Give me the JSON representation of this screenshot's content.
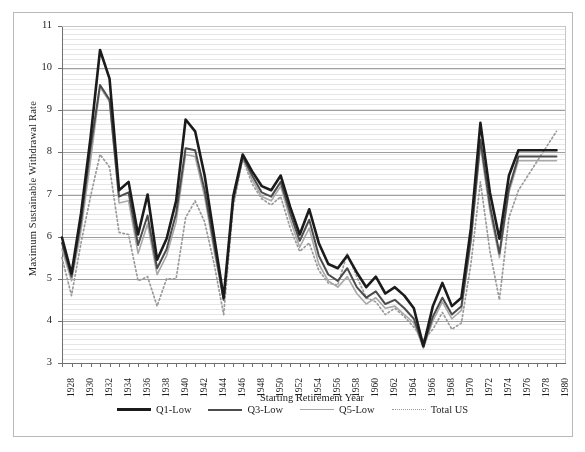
{
  "chart_data": {
    "type": "line",
    "title": "",
    "xlabel": "Starting Retirement Year",
    "ylabel": "Maximum Sustainable Withdrawal Rate",
    "xlim": [
      1928,
      1981
    ],
    "ylim": [
      3,
      11
    ],
    "ytick_step": 1,
    "xtick_step": 2,
    "grid": true,
    "legend_position": "bottom",
    "yticks": [
      3,
      4,
      5,
      6,
      7,
      8,
      9,
      10,
      11
    ],
    "ytick_labels": [
      "3",
      "4",
      "5",
      "6",
      "7",
      "8",
      "9",
      "10",
      "11"
    ],
    "x": [
      1928,
      1929,
      1930,
      1931,
      1932,
      1933,
      1934,
      1935,
      1936,
      1937,
      1938,
      1939,
      1940,
      1941,
      1942,
      1943,
      1944,
      1945,
      1946,
      1947,
      1948,
      1949,
      1950,
      1951,
      1952,
      1953,
      1954,
      1955,
      1956,
      1957,
      1958,
      1959,
      1960,
      1961,
      1962,
      1963,
      1964,
      1965,
      1966,
      1967,
      1968,
      1969,
      1970,
      1971,
      1972,
      1973,
      1974,
      1975,
      1976,
      1977,
      1978,
      1979,
      1980
    ],
    "xtick_labels": [
      "1928",
      "1930",
      "1932",
      "1934",
      "1936",
      "1938",
      "1940",
      "1942",
      "1944",
      "1946",
      "1948",
      "1950",
      "1952",
      "1954",
      "1956",
      "1958",
      "1960",
      "1962",
      "1964",
      "1966",
      "1968",
      "1970",
      "1972",
      "1974",
      "1976",
      "1978",
      "1980"
    ],
    "series": [
      {
        "name": "Q1-Low",
        "color": "#1b1b1b",
        "width": 2.6,
        "dash": "solid",
        "values": [
          5.98,
          5.12,
          6.55,
          8.35,
          10.43,
          9.75,
          7.1,
          7.3,
          6.05,
          7.0,
          5.45,
          5.95,
          6.85,
          8.78,
          8.5,
          7.45,
          6.0,
          4.55,
          6.95,
          7.95,
          7.55,
          7.2,
          7.1,
          7.45,
          6.7,
          6.05,
          6.65,
          5.85,
          5.35,
          5.25,
          5.55,
          5.15,
          4.8,
          5.05,
          4.65,
          4.8,
          4.6,
          4.3,
          3.4,
          4.35,
          4.9,
          4.35,
          4.55,
          6.2,
          8.7,
          7.05,
          5.95,
          7.45,
          8.05,
          8.05,
          8.05,
          8.05,
          8.05
        ]
      },
      {
        "name": "Q3-Low",
        "color": "#4c4c4c",
        "width": 2.0,
        "dash": "solid",
        "values": [
          5.85,
          5.05,
          6.35,
          8.1,
          9.6,
          9.25,
          6.95,
          7.05,
          5.8,
          6.5,
          5.25,
          5.7,
          6.55,
          8.1,
          8.05,
          7.1,
          5.8,
          4.5,
          6.85,
          7.9,
          7.45,
          7.05,
          6.95,
          7.3,
          6.55,
          5.9,
          6.4,
          5.55,
          5.1,
          4.95,
          5.25,
          4.8,
          4.55,
          4.7,
          4.4,
          4.5,
          4.3,
          4.05,
          3.4,
          4.1,
          4.55,
          4.15,
          4.35,
          5.95,
          8.3,
          6.75,
          5.6,
          7.15,
          7.9,
          7.9,
          7.9,
          7.9,
          7.9
        ]
      },
      {
        "name": "Q5-Low",
        "color": "#a8a8a8",
        "width": 1.6,
        "dash": "solid",
        "values": [
          5.7,
          4.95,
          6.15,
          7.8,
          9.55,
          9.2,
          6.8,
          6.85,
          5.6,
          6.3,
          5.1,
          5.55,
          6.35,
          7.95,
          7.9,
          6.95,
          5.65,
          4.5,
          6.8,
          7.85,
          7.35,
          6.95,
          6.85,
          7.2,
          6.4,
          5.75,
          6.2,
          5.35,
          4.95,
          4.8,
          5.05,
          4.65,
          4.4,
          4.55,
          4.3,
          4.35,
          4.15,
          3.95,
          3.35,
          4.0,
          4.45,
          4.05,
          4.25,
          5.85,
          8.15,
          6.6,
          5.5,
          7.05,
          7.8,
          7.8,
          7.8,
          7.8,
          7.8
        ]
      },
      {
        "name": "Total US",
        "color": "#9a9a9a",
        "width": 1.7,
        "dash": "dotted",
        "values": [
          5.5,
          4.6,
          5.85,
          6.95,
          7.95,
          7.65,
          6.1,
          6.05,
          4.95,
          5.05,
          4.35,
          5.0,
          5.0,
          6.45,
          6.85,
          6.35,
          5.35,
          4.15,
          6.7,
          7.85,
          7.25,
          6.9,
          6.75,
          6.95,
          6.2,
          5.65,
          5.85,
          5.2,
          4.9,
          4.85,
          5.6,
          5.05,
          4.55,
          4.45,
          4.15,
          4.3,
          4.1,
          3.85,
          3.55,
          3.8,
          4.2,
          3.8,
          3.95,
          5.35,
          7.3,
          5.65,
          4.5,
          6.45,
          7.1,
          7.45,
          7.8,
          8.15,
          8.5
        ]
      }
    ]
  },
  "legend": {
    "items": [
      {
        "label": "Q1-Low"
      },
      {
        "label": "Q3-Low"
      },
      {
        "label": "Q5-Low"
      },
      {
        "label": "Total US"
      }
    ]
  }
}
